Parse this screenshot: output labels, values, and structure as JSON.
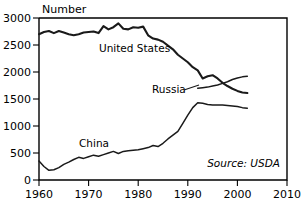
{
  "chart_data": {
    "type": "line",
    "title": "",
    "xlabel": "",
    "ylabel": "Number",
    "xlim": [
      1960,
      2010
    ],
    "ylim": [
      0,
      3000
    ],
    "xticks": [
      "1960",
      "1970",
      "1980",
      "1990",
      "2000",
      "2010"
    ],
    "xtick_values": [
      1960,
      1970,
      1980,
      1990,
      2000,
      2010
    ],
    "yticks": [
      "0",
      "500",
      "1000",
      "1500",
      "2000",
      "2500",
      "3000"
    ],
    "ytick_values": [
      0,
      500,
      1000,
      1500,
      2000,
      2500,
      3000
    ],
    "grid": false,
    "legend_position": "inline-labels",
    "annotations": [
      {
        "text": "Source: USDA",
        "x": 2002,
        "y": 270,
        "style": "italic"
      }
    ],
    "series": [
      {
        "name": "United States",
        "label": "United States",
        "color": "#1a1a1a",
        "x": [
          1960,
          1961,
          1962,
          1963,
          1964,
          1965,
          1966,
          1967,
          1968,
          1969,
          1970,
          1971,
          1972,
          1973,
          1974,
          1975,
          1976,
          1977,
          1978,
          1979,
          1980,
          1981,
          1982,
          1983,
          1984,
          1985,
          1986,
          1987,
          1988,
          1989,
          1990,
          1991,
          1992,
          1993,
          1994,
          1995,
          1996,
          1997,
          1998,
          1999,
          2000,
          2001,
          2002
        ],
        "values": [
          2700,
          2740,
          2760,
          2720,
          2760,
          2730,
          2700,
          2680,
          2700,
          2730,
          2740,
          2750,
          2720,
          2850,
          2790,
          2830,
          2900,
          2800,
          2790,
          2830,
          2820,
          2840,
          2680,
          2620,
          2600,
          2560,
          2490,
          2420,
          2320,
          2250,
          2180,
          2090,
          2030,
          1880,
          1920,
          1940,
          1880,
          1800,
          1740,
          1690,
          1650,
          1620,
          1610
        ]
      },
      {
        "name": "Russia",
        "label": "Russia",
        "color": "#1a1a1a",
        "x": [
          1992,
          1993,
          1994,
          1995,
          1996,
          1997,
          1998,
          1999,
          2000,
          2001,
          2002
        ],
        "values": [
          1700,
          1710,
          1720,
          1740,
          1760,
          1790,
          1820,
          1860,
          1890,
          1910,
          1920
        ]
      },
      {
        "name": "China",
        "label": "China",
        "color": "#1a1a1a",
        "x": [
          1960,
          1961,
          1962,
          1963,
          1964,
          1965,
          1966,
          1967,
          1968,
          1969,
          1970,
          1971,
          1972,
          1973,
          1974,
          1975,
          1976,
          1977,
          1978,
          1979,
          1980,
          1981,
          1982,
          1983,
          1984,
          1985,
          1986,
          1987,
          1988,
          1989,
          1990,
          1991,
          1992,
          1993,
          1994,
          1995,
          1996,
          1997,
          1998,
          1999,
          2000,
          2001,
          2002
        ],
        "values": [
          350,
          250,
          180,
          190,
          230,
          290,
          330,
          380,
          420,
          400,
          430,
          460,
          440,
          470,
          500,
          530,
          490,
          530,
          540,
          550,
          560,
          580,
          600,
          640,
          620,
          680,
          760,
          830,
          900,
          1050,
          1200,
          1340,
          1430,
          1420,
          1400,
          1390,
          1390,
          1390,
          1380,
          1370,
          1360,
          1340,
          1330
        ]
      }
    ]
  },
  "axis": {
    "y_title": "Number"
  },
  "source": {
    "text": "Source: USDA"
  },
  "labels": {
    "united_states": "United States",
    "russia": "Russia",
    "china": "China"
  },
  "xticks": {
    "t0": "1960",
    "t1": "1970",
    "t2": "1980",
    "t3": "1990",
    "t4": "2000",
    "t5": "2010"
  },
  "yticks": {
    "t0": "0",
    "t1": "500",
    "t2": "1000",
    "t3": "1500",
    "t4": "2000",
    "t5": "2500",
    "t6": "3000"
  }
}
